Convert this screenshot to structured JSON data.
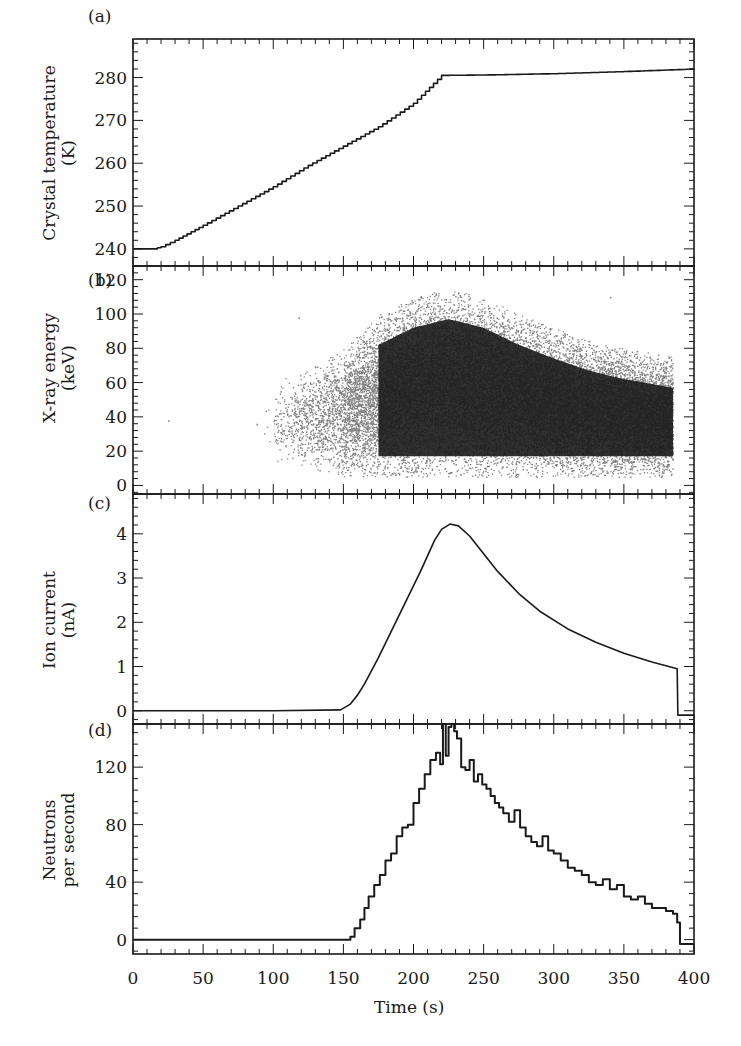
{
  "figure": {
    "panels": [
      {
        "label": "(a)",
        "ylabel_line1": "Crystal temperature",
        "ylabel_line2": "(K)"
      },
      {
        "label": "(b)",
        "ylabel_line1": "X-ray energy",
        "ylabel_line2": "(keV)"
      },
      {
        "label": "(c)",
        "ylabel_line1": "Ion current",
        "ylabel_line2": "(nA)"
      },
      {
        "label": "(d)",
        "ylabel_line1": "Neutrons",
        "ylabel_line2": "per second"
      }
    ],
    "xlabel": "Time (s)",
    "line_color": "#1a1a1a"
  },
  "chart_data": [
    {
      "panel": "(a)",
      "type": "line",
      "title": "",
      "xlabel": "Time (s)",
      "ylabel": "Crystal temperature (K)",
      "xlim": [
        0,
        400
      ],
      "ylim": [
        236,
        289
      ],
      "yticks": [
        240,
        250,
        260,
        270,
        280
      ],
      "xticks": [
        0,
        50,
        100,
        150,
        200,
        250,
        300,
        350,
        400
      ],
      "grid": false,
      "style": "staircase",
      "x": [
        0,
        15,
        20,
        30,
        50,
        75,
        100,
        125,
        150,
        175,
        200,
        220,
        250,
        300,
        350,
        400
      ],
      "y": [
        240,
        240,
        240.5,
        242,
        245.5,
        250,
        254.5,
        259.5,
        264,
        268.5,
        274,
        280.5,
        280.6,
        280.9,
        281.4,
        282
      ]
    },
    {
      "panel": "(b)",
      "type": "scatter",
      "title": "",
      "xlabel": "Time (s)",
      "ylabel": "X-ray energy (keV)",
      "xlim": [
        0,
        400
      ],
      "ylim": [
        -5,
        128
      ],
      "yticks": [
        0,
        20,
        40,
        60,
        80,
        100,
        120
      ],
      "xticks": [
        0,
        50,
        100,
        150,
        200,
        250,
        300,
        350,
        400
      ],
      "grid": false,
      "description": "Dense point cloud of X-ray events; sparse from ~100 s, dense 150-385 s, max energy envelope peaks ~115 keV near 225 s and declines to ~75 keV at 385 s; events span ~5-115 keV, densest 30-60 keV",
      "envelope_time": [
        100,
        125,
        150,
        175,
        200,
        225,
        250,
        275,
        300,
        325,
        350,
        385
      ],
      "envelope_upper_keV": [
        60,
        68,
        80,
        100,
        110,
        115,
        110,
        100,
        92,
        85,
        80,
        75
      ],
      "envelope_lower_keV": [
        15,
        10,
        5,
        5,
        5,
        5,
        5,
        5,
        5,
        5,
        5,
        5
      ],
      "end_time": 385
    },
    {
      "panel": "(c)",
      "type": "line",
      "title": "",
      "xlabel": "Time (s)",
      "ylabel": "Ion current (nA)",
      "xlim": [
        0,
        400
      ],
      "ylim": [
        -0.3,
        4.9
      ],
      "yticks": [
        0,
        1,
        2,
        3,
        4
      ],
      "xticks": [
        0,
        50,
        100,
        150,
        200,
        250,
        300,
        350,
        400
      ],
      "grid": false,
      "x": [
        0,
        50,
        100,
        148,
        155,
        160,
        165,
        175,
        185,
        195,
        205,
        215,
        220,
        226,
        232,
        240,
        250,
        260,
        275,
        290,
        310,
        330,
        350,
        370,
        388,
        388.5,
        400
      ],
      "y": [
        0,
        0,
        0,
        0.02,
        0.15,
        0.35,
        0.6,
        1.2,
        1.85,
        2.5,
        3.15,
        3.85,
        4.1,
        4.22,
        4.18,
        3.95,
        3.55,
        3.15,
        2.65,
        2.25,
        1.85,
        1.55,
        1.3,
        1.1,
        0.95,
        -0.1,
        -0.1
      ]
    },
    {
      "panel": "(d)",
      "type": "line",
      "title": "",
      "xlabel": "Time (s)",
      "ylabel": "Neutrons per second",
      "xlim": [
        0,
        400
      ],
      "ylim": [
        -10,
        150
      ],
      "yticks": [
        0,
        40,
        80,
        120
      ],
      "xticks": [
        0,
        50,
        100,
        150,
        200,
        250,
        300,
        350,
        400
      ],
      "grid": false,
      "style": "histogram-step",
      "x": [
        0,
        20,
        40,
        60,
        80,
        100,
        120,
        140,
        150,
        155,
        158,
        162,
        165,
        168,
        172,
        176,
        180,
        184,
        188,
        192,
        196,
        200,
        204,
        208,
        212,
        216,
        219,
        221,
        223,
        225,
        227,
        229,
        231,
        234,
        237,
        240,
        243,
        246,
        249,
        252,
        255,
        258,
        261,
        264,
        268,
        272,
        276,
        280,
        284,
        288,
        292,
        296,
        300,
        305,
        310,
        315,
        320,
        325,
        330,
        335,
        340,
        345,
        350,
        355,
        360,
        365,
        370,
        375,
        380,
        385,
        388,
        390,
        395,
        400
      ],
      "y": [
        0,
        0,
        0,
        0,
        0,
        0,
        0,
        0,
        0,
        2,
        8,
        14,
        22,
        30,
        38,
        45,
        55,
        60,
        72,
        78,
        80,
        95,
        105,
        115,
        125,
        130,
        122,
        150,
        128,
        148,
        150,
        145,
        140,
        120,
        118,
        125,
        110,
        115,
        108,
        105,
        100,
        95,
        92,
        88,
        82,
        90,
        78,
        72,
        68,
        65,
        72,
        62,
        60,
        55,
        50,
        48,
        45,
        40,
        38,
        42,
        35,
        38,
        30,
        28,
        30,
        25,
        22,
        22,
        20,
        18,
        12,
        -3,
        -3,
        -3
      ]
    }
  ]
}
